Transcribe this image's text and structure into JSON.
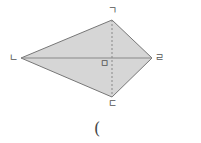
{
  "diagram": {
    "shape": "kite",
    "fill_color": "#d6d6d6",
    "stroke_color": "#777777",
    "vertices": {
      "top": {
        "label": "ㄱ",
        "x": 112,
        "y": 20
      },
      "left": {
        "label": "ㄴ",
        "x": 21,
        "y": 58
      },
      "bottom": {
        "label": "ㄷ",
        "x": 112,
        "y": 97
      },
      "right": {
        "label": "ㄹ",
        "x": 152,
        "y": 58
      }
    },
    "center": {
      "label": "ㅁ",
      "x": 112,
      "y": 58
    }
  },
  "answer": {
    "paren": "("
  }
}
